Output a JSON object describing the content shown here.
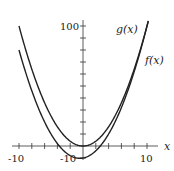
{
  "chart_data": {
    "type": "line",
    "title": "",
    "xlabel": "x",
    "ylabel": "",
    "xlim": [
      -10.5,
      11.5
    ],
    "ylim": [
      -12,
      105
    ],
    "grid": false,
    "legend": "inline labels at curve ends",
    "x_ticks": [
      -10,
      -8,
      -6,
      -4,
      -2,
      0,
      2,
      4,
      6,
      8,
      10
    ],
    "x_tick_labels": [
      {
        "value": -10,
        "label": "-10"
      },
      {
        "value": 10,
        "label": "10"
      }
    ],
    "y_ticks": [
      -10,
      0,
      10,
      20,
      30,
      40,
      50,
      60,
      70,
      80,
      90,
      100
    ],
    "y_tick_labels": [
      {
        "value": 100,
        "label": "100"
      },
      {
        "value": -10,
        "label": "-10"
      }
    ],
    "x": [
      -10,
      -8,
      -6,
      -4,
      -2,
      0,
      2,
      4,
      6,
      8,
      10
    ],
    "series": [
      {
        "name": "g(x)",
        "values": [
          100,
          64,
          36,
          16,
          4,
          0,
          4,
          16,
          36,
          64,
          100
        ]
      },
      {
        "name": "f(x)",
        "values": [
          80,
          46,
          20,
          2,
          -8,
          -10,
          -4,
          10,
          32,
          62,
          100
        ]
      }
    ],
    "annotations": [
      "g(x)",
      "f(x)"
    ]
  },
  "labels": {
    "x_axis": "x",
    "x_min": "-10",
    "x_max": "10",
    "y_max": "100",
    "y_min": "-10",
    "g": "g(x)",
    "f": "f(x)"
  }
}
